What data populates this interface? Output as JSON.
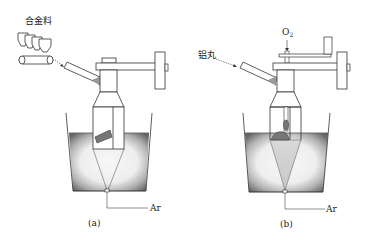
{
  "figure": {
    "panels": [
      {
        "id": "a",
        "caption": "(a)",
        "feed_label": "合金料",
        "gas_label": "Ar"
      },
      {
        "id": "b",
        "caption": "(b)",
        "feed_label": "铝丸",
        "top_gas_label": "O",
        "top_gas_subscript": "2",
        "gas_label": "Ar"
      }
    ],
    "colors": {
      "line": "#333333",
      "melt_dark": "#6e6e6e",
      "melt_light": "#f4f4f4",
      "background": "#ffffff"
    }
  }
}
